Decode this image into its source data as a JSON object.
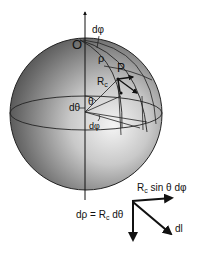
{
  "figure": {
    "labels": {
      "origin": "O",
      "d_phi_top": "dφ",
      "rho": "ρ",
      "point": "P",
      "radius": "R",
      "radius_sub": "c",
      "theta": "θ",
      "d_theta": "dθ",
      "d_phi_bottom": "dφ"
    },
    "vector_diagram": {
      "horizontal_label_main": "R",
      "horizontal_label_sub": "c",
      "horizontal_label_rest": " sin θ dφ",
      "vertical_label_pre": "dρ = R",
      "vertical_label_sub": "c",
      "vertical_label_rest": " dθ",
      "diagonal_label": "dl"
    },
    "colors": {
      "line": "#111111",
      "sphere_light": "#f2f2f2",
      "sphere_dark": "#3a3a3a",
      "background": "#ffffff"
    }
  }
}
